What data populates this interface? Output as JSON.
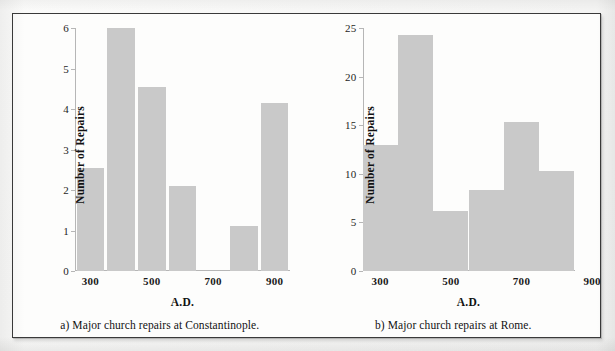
{
  "figure": {
    "panels": [
      {
        "id": "panel-a",
        "caption": "a) Major church repairs at Constantinople.",
        "chart_data": {
          "type": "bar",
          "title": "a) Major church repairs at Constantinople.",
          "xlabel": "A.D.",
          "ylabel": "Number of Repairs",
          "categories": [
            "300",
            "400",
            "500",
            "600",
            "700",
            "800",
            "900"
          ],
          "xtick_labels": [
            "300",
            "500",
            "700",
            "900"
          ],
          "xticks": [
            300,
            500,
            700,
            900
          ],
          "values": [
            2.55,
            6.0,
            4.55,
            2.1,
            0,
            1.1,
            4.15
          ],
          "ylim": [
            0,
            6
          ],
          "yticks": [
            0,
            1,
            2,
            3,
            4,
            5,
            6
          ],
          "ytick_labels": [
            "0",
            "1",
            "2",
            "3",
            "4",
            "5",
            "6"
          ],
          "grid": false,
          "legend": "none",
          "bar_color": "#c9c9c9"
        }
      },
      {
        "id": "panel-b",
        "caption": "b) Major church repairs at Rome.",
        "chart_data": {
          "type": "bar",
          "title": "b) Major church repairs at Rome.",
          "xlabel": "A.D.",
          "ylabel": "Number of Repairs",
          "categories": [
            "300",
            "400",
            "500",
            "600",
            "700",
            "800"
          ],
          "xtick_labels": [
            "300",
            "500",
            "700",
            "900"
          ],
          "xticks": [
            300,
            500,
            700,
            900
          ],
          "values": [
            13.0,
            24.3,
            6.2,
            8.3,
            15.3,
            10.3
          ],
          "ylim": [
            0,
            25
          ],
          "yticks": [
            0,
            5,
            10,
            15,
            20,
            25
          ],
          "ytick_labels": [
            "0",
            "5",
            "10",
            "15",
            "20",
            "25"
          ],
          "grid": false,
          "legend": "none",
          "bar_color": "#c9c9c9"
        }
      }
    ]
  }
}
